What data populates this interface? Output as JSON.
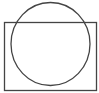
{
  "diagram": {
    "title": "",
    "shapes": [
      {
        "kind": "rectangle",
        "label": "",
        "stroke": "#444444",
        "fill": "none"
      },
      {
        "kind": "circle",
        "label": "",
        "stroke": "#444444",
        "fill": "none"
      }
    ],
    "relation": "circle overlaps rectangle, extending above its top edge"
  }
}
